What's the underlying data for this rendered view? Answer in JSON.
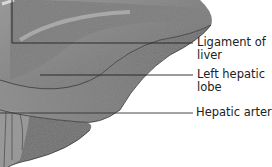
{
  "diagram": {
    "labels": [
      {
        "id": "ligament",
        "text_line1": "Ligament of",
        "text_line2": "liver"
      },
      {
        "id": "left_lobe",
        "text_line1": "Left hepatic",
        "text_line2": "lobe"
      },
      {
        "id": "artery",
        "text_line1": "Hepatic artery"
      }
    ],
    "colors": {
      "organ_fill": "#8a8a8a",
      "organ_dark": "#4a4a4a",
      "organ_light": "#b5b5b5",
      "leader_line": "#222222",
      "text": "#222222"
    }
  }
}
